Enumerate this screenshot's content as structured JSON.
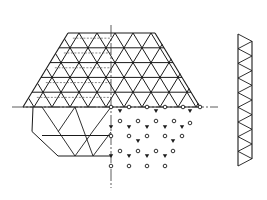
{
  "diagram": {
    "title": "Triangular space grid: plan, node layout and section",
    "colors": {
      "line": "#1a1a1a",
      "background": "#ffffff",
      "axis": "#333333"
    },
    "axes": {
      "center_x": 111,
      "center_y": 107,
      "h_from": 12,
      "h_to": 218,
      "v_from": 25,
      "v_to": 188
    },
    "grid": {
      "top_y": 33,
      "base_y": 107,
      "row_h": 14.8,
      "tri_w": 18,
      "top_left_x": 68,
      "top_right_x": 155,
      "base_left_x": 23,
      "base_right_x": 200
    },
    "lower_hex": {
      "top_y": 107,
      "bottom_y": 156,
      "left_bottom_x": 58,
      "left_mid_x": 32,
      "right_x": 111
    },
    "nodes": {
      "open": [
        [
          111,
          107
        ],
        [
          129,
          107
        ],
        [
          147,
          107
        ],
        [
          165,
          107
        ],
        [
          183,
          107
        ],
        [
          200,
          107
        ],
        [
          120,
          121
        ],
        [
          138,
          121
        ],
        [
          156,
          121
        ],
        [
          174,
          121
        ],
        [
          190,
          123
        ],
        [
          111,
          136
        ],
        [
          129,
          136
        ],
        [
          147,
          136
        ],
        [
          165,
          136
        ],
        [
          182,
          136
        ],
        [
          120,
          151
        ],
        [
          138,
          151
        ],
        [
          156,
          151
        ],
        [
          173,
          151
        ],
        [
          111,
          166
        ],
        [
          129,
          166
        ],
        [
          147,
          166
        ],
        [
          165,
          166
        ]
      ],
      "filled": [
        [
          120,
          111
        ],
        [
          156,
          111
        ],
        [
          190,
          111
        ],
        [
          111,
          127
        ],
        [
          129,
          127
        ],
        [
          147,
          127
        ],
        [
          165,
          127
        ],
        [
          182,
          127
        ],
        [
          138,
          141
        ],
        [
          173,
          141
        ],
        [
          111,
          156
        ],
        [
          129,
          156
        ],
        [
          147,
          156
        ],
        [
          165,
          156
        ]
      ]
    },
    "section": {
      "x_left": 238,
      "x_right": 252,
      "top_y": 34,
      "bottom_y": 166,
      "panels": 9
    }
  }
}
